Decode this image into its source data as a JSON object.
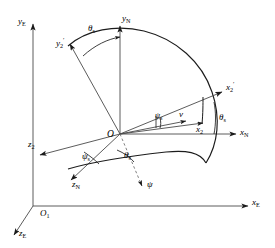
{
  "figure": {
    "type": "coordinate-frame-rotation-diagram",
    "background_color": "#ffffff",
    "line_color": "#3a3a3a",
    "accent_color": "#000000",
    "width": 275,
    "height": 248
  },
  "labels": {
    "y_e": "y",
    "y_e_sub": "E",
    "x_e": "x",
    "x_e_sub": "E",
    "z_e": "z",
    "z_e_sub": "E",
    "o_one": "O",
    "o_one_sub": "1",
    "y_n": "y",
    "y_n_sub": "N",
    "x_n": "x",
    "x_n_sub": "N",
    "z_n": "z",
    "z_n_sub": "N",
    "o_origin": "O",
    "y_two_prime": "y",
    "y_two_prime_sub": "2",
    "y_two_prime_sup": "′",
    "x_two_prime": "x",
    "x_two_prime_sub": "2",
    "x_two_prime_sup": "′",
    "x_two": "x",
    "x_two_sub": "2",
    "z_two": "z",
    "z_two_sub": "2",
    "theta_top": "θ",
    "theta_top_sub": "s",
    "theta_right": "θ",
    "theta_right_sub": "s",
    "theta_lower": "θ",
    "theta_lower_sub": "s",
    "psi_s": "ψ",
    "psi_s_sub": "s",
    "psi_left": "ψ",
    "psi_left_sub": "s",
    "psi_plain": "ψ",
    "v_vector": "v"
  },
  "annotations": {
    "arc_label": "unit-sphere-great-circle",
    "earth_frame": "E-frame axes: x_E, y_E, z_E at origin O_1",
    "nav_frame": "N-frame axes: x_N, y_N, z_N at origin O",
    "body_frame": "2-frame axes: x_2, y_2', z_2, x_2'"
  }
}
